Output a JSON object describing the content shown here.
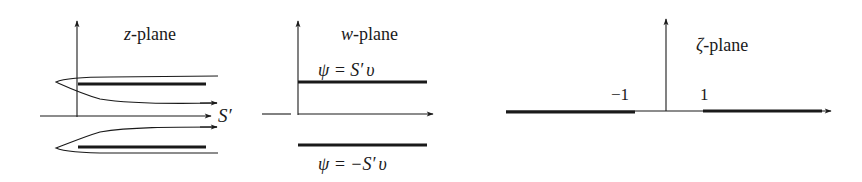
{
  "figure": {
    "panels": [
      {
        "id": "z-plane",
        "title_var": "z",
        "title_suffix": "-plane",
        "labels": {
          "flow": "S′"
        }
      },
      {
        "id": "w-plane",
        "title_var": "w",
        "title_suffix": "-plane",
        "labels": {
          "upper": {
            "var": "ψ",
            "eq": " = S′",
            "v": "υ"
          },
          "lower": {
            "var": "ψ",
            "eq": " = −S′",
            "v": "υ"
          }
        }
      },
      {
        "id": "zeta-plane",
        "title_var": "ζ",
        "title_suffix": "-plane",
        "labels": {
          "neg_one": "−1",
          "one": "1"
        }
      }
    ],
    "colors": {
      "ink": "#1a1a1a",
      "background": "#ffffff"
    }
  }
}
